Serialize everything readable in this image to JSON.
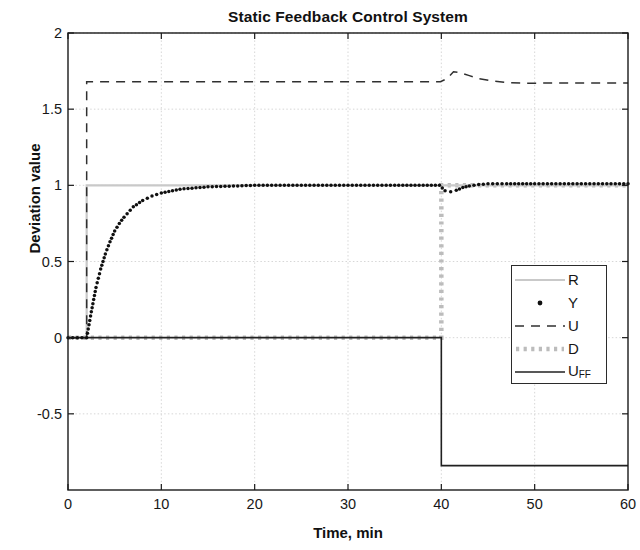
{
  "chart_data": {
    "type": "line",
    "title": "Static Feedback Control System",
    "xlabel": "Time, min",
    "ylabel": "Deviation value",
    "xlim": [
      0,
      60
    ],
    "ylim": [
      -1,
      2
    ],
    "xticks": [
      0,
      10,
      20,
      30,
      40,
      50,
      60
    ],
    "yticks": [
      -0.5,
      0,
      0.5,
      1,
      1.5,
      2
    ],
    "ytick_labels": [
      "-0.5",
      "0",
      "0.5",
      "1",
      "1.5",
      "2"
    ],
    "xtick_labels": [
      "0",
      "10",
      "20",
      "30",
      "40",
      "50",
      "60"
    ],
    "grid": true,
    "legend_position": "center-right",
    "series": [
      {
        "name": "R",
        "label": "R",
        "style": "solid",
        "color": "#c9c9c9",
        "width": 2.2,
        "description": "Setpoint step from 0 to 1 at t = 2 min",
        "x": [
          0,
          2,
          2,
          60
        ],
        "y": [
          0,
          0,
          1,
          1
        ]
      },
      {
        "name": "Y",
        "label": "Y",
        "style": "dotted-markers",
        "color": "#101010",
        "width": 3.2,
        "description": "Controlled output: first-order rise to setpoint 1 after t = 2, small dip to 0.96 at the disturbance at t = 40, recovering to 1.01",
        "x": [
          0,
          1,
          2,
          2.5,
          3,
          3.5,
          4,
          4.5,
          5,
          5.5,
          6,
          7,
          8,
          9,
          10,
          12,
          15,
          20,
          25,
          30,
          35,
          39.8,
          40.4,
          41,
          41.6,
          42.3,
          43,
          44,
          45,
          47,
          50,
          55,
          60
        ],
        "y": [
          0,
          0,
          0,
          0.17,
          0.33,
          0.45,
          0.55,
          0.63,
          0.7,
          0.75,
          0.79,
          0.86,
          0.9,
          0.93,
          0.95,
          0.975,
          0.99,
          1.0,
          1.0,
          1.0,
          1.0,
          1.0,
          0.965,
          0.958,
          0.968,
          0.985,
          0.995,
          1.005,
          1.01,
          1.01,
          1.01,
          1.01,
          1.01
        ]
      },
      {
        "name": "U",
        "label": "U",
        "style": "dashed",
        "color": "#303030",
        "width": 1.5,
        "description": "Controller output: steps to 1.68 at t = 2, bumps to 1.74 just after the disturbance at t = 40, settles back near 1.67",
        "x": [
          0,
          2,
          2,
          39.9,
          40.6,
          41.3,
          42,
          43,
          44,
          45.5,
          47,
          49,
          52,
          56,
          60
        ],
        "y": [
          0,
          0,
          1.68,
          1.68,
          1.7,
          1.745,
          1.74,
          1.72,
          1.7,
          1.685,
          1.675,
          1.67,
          1.672,
          1.672,
          1.672
        ]
      },
      {
        "name": "D",
        "label": "D",
        "style": "dotted-thick",
        "color": "#bcbcbc",
        "width": 4.5,
        "description": "Disturbance: 0 until t = 40, then steps to 1",
        "x": [
          0,
          40,
          40,
          60
        ],
        "y": [
          0,
          0,
          1,
          1
        ]
      },
      {
        "name": "U_FF",
        "label": "U",
        "label_sub": "FF",
        "style": "solid",
        "color": "#202020",
        "width": 1.6,
        "description": "Feedforward signal: 0 until t = 40, then steps down to -0.84",
        "x": [
          0,
          40,
          40,
          60
        ],
        "y": [
          0,
          0,
          -0.84,
          -0.84
        ]
      }
    ],
    "annotations": [
      {
        "time": 2,
        "event": "setpoint step"
      },
      {
        "time": 40,
        "event": "disturbance step"
      }
    ]
  },
  "legend": {
    "entries": [
      {
        "label": "R",
        "sub": ""
      },
      {
        "label": "Y",
        "sub": ""
      },
      {
        "label": "U",
        "sub": ""
      },
      {
        "label": "D",
        "sub": ""
      },
      {
        "label": "U",
        "sub": "FF"
      }
    ]
  }
}
